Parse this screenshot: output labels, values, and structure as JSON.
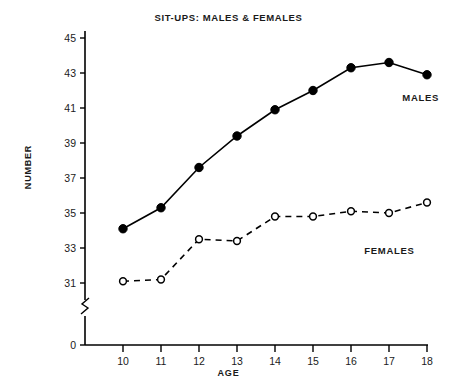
{
  "chart_data": {
    "type": "line",
    "title": "SIT-UPS: MALES & FEMALES",
    "xlabel": "AGE",
    "ylabel": "NUMBER",
    "x": [
      10,
      11,
      12,
      13,
      14,
      15,
      16,
      17,
      18
    ],
    "categories": [
      "10",
      "11",
      "12",
      "13",
      "14",
      "15",
      "16",
      "17",
      "18"
    ],
    "xlim": [
      10,
      18
    ],
    "ylim": [
      31,
      45
    ],
    "yticks": [
      31,
      33,
      35,
      37,
      39,
      41,
      43,
      45
    ],
    "ytick_labels": [
      "31",
      "33",
      "35",
      "37",
      "39",
      "41",
      "43",
      "45"
    ],
    "xticks": [
      10,
      11,
      12,
      13,
      14,
      15,
      16,
      17,
      18
    ],
    "xtick_labels": [
      "10",
      "11",
      "12",
      "13",
      "14",
      "15",
      "16",
      "17",
      "18"
    ],
    "origin_label": "0",
    "axis_break": true,
    "grid": false,
    "legend_position": "inline-right",
    "series": [
      {
        "name": "MALES",
        "marker": "filled-circle",
        "linestyle": "solid",
        "color": "#000000",
        "values": [
          34.1,
          35.3,
          37.6,
          39.4,
          40.9,
          42.0,
          43.3,
          43.6,
          42.9
        ]
      },
      {
        "name": "FEMALES",
        "marker": "open-circle",
        "linestyle": "dashed",
        "color": "#000000",
        "values": [
          31.1,
          31.2,
          33.5,
          33.4,
          34.8,
          34.8,
          35.1,
          35.0,
          35.6
        ]
      }
    ],
    "annotations": [
      {
        "text": "MALES",
        "x": 17.35,
        "y": 41.9
      },
      {
        "text": "FEMALES",
        "x": 16.35,
        "y": 33.15
      }
    ]
  }
}
